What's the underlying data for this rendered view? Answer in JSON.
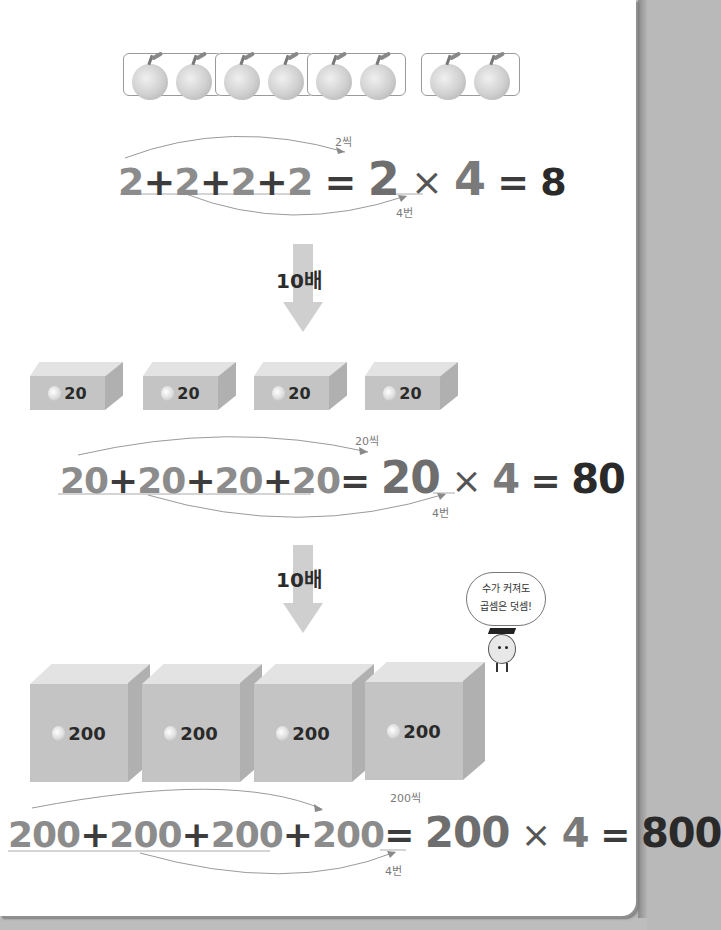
{
  "section1": {
    "groups": [
      {
        "label": "apple-pair",
        "count": 2
      },
      {
        "label": "apple-pair",
        "count": 2
      },
      {
        "label": "apple-pair",
        "count": 2
      },
      {
        "label": "apple-pair",
        "count": 2
      }
    ],
    "equation": {
      "terms": [
        "2",
        "2",
        "2",
        "2"
      ],
      "plus": "+",
      "equals": "=",
      "factor": "2",
      "times": "×",
      "count": "4",
      "result": "8",
      "each_label": "2씩",
      "times_label": "4번"
    }
  },
  "arrow1": {
    "label": "10배"
  },
  "section2": {
    "boxes": [
      {
        "icon": "apple-icon",
        "value": "20"
      },
      {
        "icon": "apple-icon",
        "value": "20"
      },
      {
        "icon": "apple-icon",
        "value": "20"
      },
      {
        "icon": "apple-icon",
        "value": "20"
      }
    ],
    "equation": {
      "terms": [
        "20",
        "20",
        "20",
        "20"
      ],
      "plus": "+",
      "equals": "=",
      "factor": "20",
      "times": "×",
      "count": "4",
      "result": "80",
      "each_label": "20씩",
      "times_label": "4번"
    }
  },
  "arrow2": {
    "label": "10배"
  },
  "speech_bubble": {
    "line1": "수가 커져도",
    "line2": "곱셈은 덧셈!"
  },
  "section3": {
    "boxes": [
      {
        "icon": "apple-icon",
        "value": "200"
      },
      {
        "icon": "apple-icon",
        "value": "200"
      },
      {
        "icon": "apple-icon",
        "value": "200"
      },
      {
        "icon": "apple-icon",
        "value": "200"
      }
    ],
    "equation": {
      "terms": [
        "200",
        "200",
        "200",
        "200"
      ],
      "plus": "+",
      "equals": "=",
      "factor": "200",
      "times": "×",
      "count": "4",
      "result": "800",
      "each_label": "200씩",
      "times_label": "4번"
    }
  }
}
